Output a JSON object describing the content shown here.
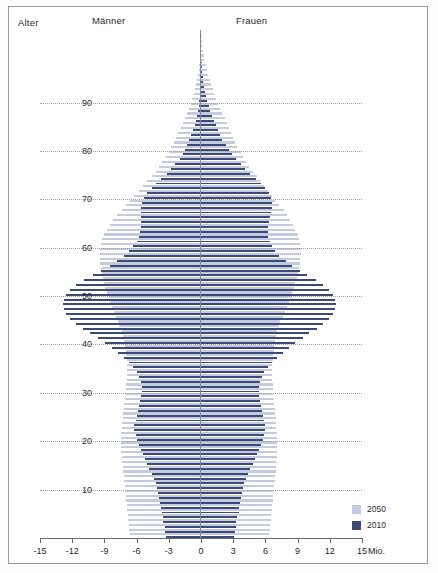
{
  "header": {
    "age_label": "Alter",
    "men_label": "Männer",
    "women_label": "Frauen"
  },
  "legend": {
    "items": [
      {
        "label": "2050",
        "color": "#c5cbdf"
      },
      {
        "label": "2010",
        "color": "#3b4a78"
      }
    ]
  },
  "axis": {
    "unit": "Mio.",
    "x_ticks": [
      "-15",
      "-12",
      "-9",
      "-6",
      "-3",
      "0",
      "3",
      "6",
      "9",
      "12",
      "15"
    ],
    "y_ticks": [
      "90",
      "80",
      "70",
      "60",
      "50",
      "40",
      "30",
      "20",
      "10"
    ]
  },
  "chart_data": {
    "type": "bar",
    "title": "",
    "subtitle": "",
    "xlabel": "Mio.",
    "ylabel": "Alter",
    "xlim": [
      -15,
      15
    ],
    "ylim": [
      0,
      105
    ],
    "grid": true,
    "legend_position": "bottom-right",
    "orientation": "population-pyramid",
    "x_ticks": [
      -15,
      -12,
      -9,
      -6,
      -3,
      0,
      3,
      6,
      9,
      12,
      15
    ],
    "y_ticks": [
      10,
      20,
      30,
      40,
      50,
      60,
      70,
      80,
      90
    ],
    "categories_note": "age in single years, 0 at bottom to ~104 at top",
    "series": [
      {
        "name": "2050",
        "color": "#c5cbdf",
        "side_men_negative": true,
        "ages": [
          0,
          1,
          2,
          3,
          4,
          5,
          6,
          7,
          8,
          9,
          10,
          11,
          12,
          13,
          14,
          15,
          16,
          17,
          18,
          19,
          20,
          21,
          22,
          23,
          24,
          25,
          26,
          27,
          28,
          29,
          30,
          31,
          32,
          33,
          34,
          35,
          36,
          37,
          38,
          39,
          40,
          41,
          42,
          43,
          44,
          45,
          46,
          47,
          48,
          49,
          50,
          51,
          52,
          53,
          54,
          55,
          56,
          57,
          58,
          59,
          60,
          61,
          62,
          63,
          64,
          65,
          66,
          67,
          68,
          69,
          70,
          71,
          72,
          73,
          74,
          75,
          76,
          77,
          78,
          79,
          80,
          81,
          82,
          83,
          84,
          85,
          86,
          87,
          88,
          89,
          90,
          91,
          92,
          93,
          94,
          95,
          96,
          97,
          98,
          99,
          100,
          101,
          102,
          103,
          104
        ],
        "men": [
          -6.6,
          -6.7,
          -6.7,
          -6.8,
          -6.8,
          -6.9,
          -6.9,
          -7.0,
          -7.0,
          -7.1,
          -7.1,
          -7.2,
          -7.2,
          -7.3,
          -7.3,
          -7.4,
          -7.4,
          -7.5,
          -7.5,
          -7.5,
          -7.5,
          -7.5,
          -7.4,
          -7.4,
          -7.3,
          -7.3,
          -7.2,
          -7.2,
          -7.1,
          -7.1,
          -7.0,
          -7.0,
          -6.9,
          -6.9,
          -6.9,
          -6.9,
          -6.9,
          -7.0,
          -7.0,
          -7.1,
          -7.2,
          -7.3,
          -7.4,
          -7.6,
          -7.7,
          -7.9,
          -8.1,
          -8.3,
          -8.5,
          -8.6,
          -8.8,
          -8.9,
          -9.0,
          -9.1,
          -9.2,
          -9.3,
          -9.4,
          -9.4,
          -9.4,
          -9.4,
          -9.3,
          -9.2,
          -9.0,
          -8.8,
          -8.5,
          -8.2,
          -7.8,
          -7.4,
          -7.0,
          -6.6,
          -6.2,
          -5.8,
          -5.4,
          -5.0,
          -4.6,
          -4.2,
          -3.9,
          -3.6,
          -3.3,
          -3.0,
          -2.8,
          -2.5,
          -2.3,
          -2.1,
          -1.9,
          -1.7,
          -1.5,
          -1.3,
          -1.1,
          -0.95,
          -0.8,
          -0.68,
          -0.56,
          -0.46,
          -0.37,
          -0.29,
          -0.22,
          -0.17,
          -0.12,
          -0.09,
          -0.06,
          -0.04,
          -0.03,
          -0.02,
          -0.01
        ],
        "women": [
          6.3,
          6.4,
          6.4,
          6.5,
          6.5,
          6.6,
          6.6,
          6.7,
          6.7,
          6.8,
          6.8,
          6.9,
          6.9,
          7.0,
          7.0,
          7.0,
          7.1,
          7.1,
          7.1,
          7.1,
          7.1,
          7.1,
          7.0,
          7.0,
          7.0,
          6.9,
          6.9,
          6.8,
          6.8,
          6.7,
          6.7,
          6.7,
          6.6,
          6.6,
          6.6,
          6.6,
          6.7,
          6.7,
          6.8,
          6.8,
          6.9,
          7.0,
          7.1,
          7.3,
          7.4,
          7.6,
          7.8,
          8.0,
          8.2,
          8.4,
          8.5,
          8.7,
          8.8,
          8.9,
          9.0,
          9.1,
          9.2,
          9.2,
          9.3,
          9.3,
          9.2,
          9.1,
          9.0,
          8.8,
          8.6,
          8.3,
          8.0,
          7.7,
          7.3,
          6.9,
          6.6,
          6.2,
          5.9,
          5.5,
          5.2,
          4.8,
          4.5,
          4.2,
          3.9,
          3.7,
          3.4,
          3.2,
          3.0,
          2.8,
          2.6,
          2.4,
          2.2,
          2.0,
          1.8,
          1.6,
          1.4,
          1.25,
          1.1,
          0.95,
          0.8,
          0.66,
          0.53,
          0.42,
          0.32,
          0.24,
          0.17,
          0.12,
          0.08,
          0.05,
          0.03
        ]
      },
      {
        "name": "2010",
        "color": "#3b4a78",
        "side_men_negative": true,
        "ages": [
          0,
          1,
          2,
          3,
          4,
          5,
          6,
          7,
          8,
          9,
          10,
          11,
          12,
          13,
          14,
          15,
          16,
          17,
          18,
          19,
          20,
          21,
          22,
          23,
          24,
          25,
          26,
          27,
          28,
          29,
          30,
          31,
          32,
          33,
          34,
          35,
          36,
          37,
          38,
          39,
          40,
          41,
          42,
          43,
          44,
          45,
          46,
          47,
          48,
          49,
          50,
          51,
          52,
          53,
          54,
          55,
          56,
          57,
          58,
          59,
          60,
          61,
          62,
          63,
          64,
          65,
          66,
          67,
          68,
          69,
          70,
          71,
          72,
          73,
          74,
          75,
          76,
          77,
          78,
          79,
          80,
          81,
          82,
          83,
          84,
          85,
          86,
          87,
          88,
          89,
          90,
          91,
          92,
          93,
          94,
          95,
          96,
          97,
          98,
          99,
          100,
          101,
          102,
          103,
          104
        ],
        "men": [
          -3.3,
          -3.4,
          -3.4,
          -3.5,
          -3.5,
          -3.6,
          -3.7,
          -3.8,
          -3.9,
          -4.0,
          -4.1,
          -4.2,
          -4.4,
          -4.6,
          -4.8,
          -5.0,
          -5.2,
          -5.4,
          -5.6,
          -5.8,
          -6.0,
          -6.1,
          -6.2,
          -6.2,
          -6.1,
          -6.0,
          -5.9,
          -5.8,
          -5.7,
          -5.6,
          -5.5,
          -5.5,
          -5.6,
          -5.8,
          -6.0,
          -6.3,
          -6.7,
          -7.2,
          -7.7,
          -8.3,
          -8.9,
          -9.6,
          -10.3,
          -11.0,
          -11.6,
          -12.2,
          -12.6,
          -12.8,
          -12.9,
          -12.8,
          -12.6,
          -12.2,
          -11.6,
          -10.9,
          -10.1,
          -9.3,
          -8.5,
          -7.8,
          -7.2,
          -6.7,
          -6.3,
          -6.0,
          -5.8,
          -5.7,
          -5.6,
          -5.6,
          -5.6,
          -5.6,
          -5.6,
          -5.5,
          -5.3,
          -5.0,
          -4.6,
          -4.2,
          -3.7,
          -3.2,
          -2.8,
          -2.4,
          -2.0,
          -1.7,
          -1.5,
          -1.3,
          -1.1,
          -0.9,
          -0.75,
          -0.6,
          -0.48,
          -0.38,
          -0.3,
          -0.23,
          -0.17,
          -0.13,
          -0.09,
          -0.07,
          -0.05,
          -0.03,
          -0.02,
          -0.015,
          -0.01,
          -0.008,
          -0.005,
          -0.003,
          -0.002,
          -0.001,
          -0.001
        ],
        "women": [
          3.1,
          3.2,
          3.3,
          3.3,
          3.4,
          3.5,
          3.5,
          3.6,
          3.7,
          3.8,
          3.9,
          4.0,
          4.2,
          4.4,
          4.6,
          4.8,
          5.0,
          5.2,
          5.4,
          5.6,
          5.8,
          5.9,
          6.0,
          6.0,
          5.9,
          5.8,
          5.7,
          5.6,
          5.5,
          5.4,
          5.4,
          5.4,
          5.5,
          5.7,
          5.9,
          6.2,
          6.6,
          7.1,
          7.6,
          8.2,
          8.8,
          9.5,
          10.1,
          10.8,
          11.4,
          11.9,
          12.3,
          12.5,
          12.6,
          12.5,
          12.3,
          11.9,
          11.4,
          10.7,
          9.9,
          9.2,
          8.5,
          7.9,
          7.3,
          6.9,
          6.6,
          6.4,
          6.2,
          6.2,
          6.2,
          6.3,
          6.4,
          6.5,
          6.6,
          6.6,
          6.5,
          6.3,
          6.0,
          5.6,
          5.1,
          4.6,
          4.1,
          3.7,
          3.3,
          2.9,
          2.6,
          2.3,
          2.0,
          1.8,
          1.6,
          1.4,
          1.2,
          1.0,
          0.85,
          0.7,
          0.56,
          0.44,
          0.34,
          0.26,
          0.19,
          0.14,
          0.1,
          0.07,
          0.05,
          0.03,
          0.02,
          0.013,
          0.008,
          0.005,
          0.003
        ]
      }
    ]
  }
}
